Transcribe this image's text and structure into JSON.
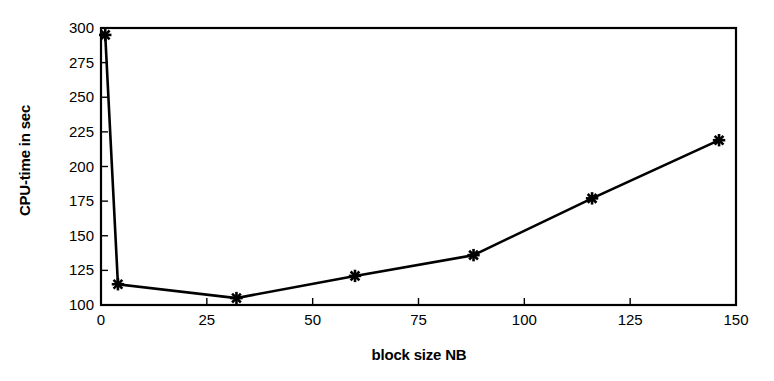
{
  "chart_data": {
    "type": "line",
    "title": "",
    "xlabel": "block size NB",
    "ylabel": "CPU-time in sec",
    "xlim": [
      0,
      150
    ],
    "ylim": [
      100,
      300
    ],
    "xticks": [
      0,
      25,
      50,
      75,
      100,
      125,
      150
    ],
    "yticks": [
      100,
      125,
      150,
      175,
      200,
      225,
      250,
      275,
      300
    ],
    "xtick_labels": [
      "0",
      "25",
      "50",
      "75",
      "100",
      "125",
      "150"
    ],
    "ytick_labels": [
      "100",
      "125",
      "150",
      "175",
      "200",
      "225",
      "250",
      "275",
      "300"
    ],
    "grid": false,
    "legend": null,
    "marker": "x-star",
    "line_color": "#000000",
    "marker_color": "#000000",
    "background_color": "#ffffff",
    "frame": "box",
    "series": [
      {
        "name": "CPU-time",
        "x": [
          1,
          4,
          32,
          60,
          88,
          116,
          146
        ],
        "values": [
          295,
          115,
          105,
          121,
          136,
          177,
          219
        ],
        "points": [
          {
            "x": 1,
            "y": 295
          },
          {
            "x": 4,
            "y": 115
          },
          {
            "x": 32,
            "y": 105
          },
          {
            "x": 60,
            "y": 121
          },
          {
            "x": 88,
            "y": 136
          },
          {
            "x": 116,
            "y": 177
          },
          {
            "x": 146,
            "y": 219
          }
        ]
      }
    ]
  }
}
